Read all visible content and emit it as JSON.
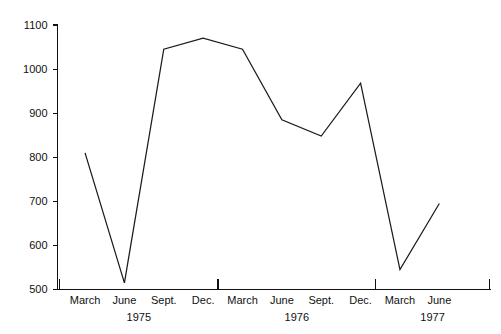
{
  "chart_data": {
    "type": "line",
    "title": "",
    "subtitle": "",
    "xlabel": "",
    "ylabel": "",
    "ylim": [
      500,
      1100
    ],
    "ytick_values": [
      500,
      600,
      700,
      800,
      900,
      1000,
      1100
    ],
    "ytick_labels": [
      "500",
      "600",
      "700",
      "800",
      "900",
      "1000",
      "1100"
    ],
    "grid": false,
    "legend": null,
    "legend_position": "none",
    "categories": [
      "March",
      "June",
      "Sept.",
      "Dec.",
      "March",
      "June",
      "Sept.",
      "Dec.",
      "March",
      "June"
    ],
    "x_group_labels": [
      "1975",
      "1976",
      "1977"
    ],
    "x_groups": [
      {
        "label": "1975",
        "categories": [
          "March",
          "June",
          "Sept.",
          "Dec."
        ]
      },
      {
        "label": "1976",
        "categories": [
          "March",
          "June",
          "Sept.",
          "Dec."
        ]
      },
      {
        "label": "1977",
        "categories": [
          "March",
          "June"
        ]
      }
    ],
    "points": [
      {
        "period": "March 1975",
        "value": 810
      },
      {
        "period": "June 1975",
        "value": 515
      },
      {
        "period": "Sept. 1975",
        "value": 1045
      },
      {
        "period": "Dec. 1975",
        "value": 1070
      },
      {
        "period": "March 1976",
        "value": 1045
      },
      {
        "period": "June 1976",
        "value": 885
      },
      {
        "period": "Sept. 1976",
        "value": 848
      },
      {
        "period": "Dec. 1976",
        "value": 968
      },
      {
        "period": "March 1977",
        "value": 545
      },
      {
        "period": "June 1977",
        "value": 695
      }
    ],
    "values": [
      810,
      515,
      1045,
      1070,
      1045,
      885,
      848,
      968,
      545,
      695
    ],
    "series": [
      {
        "name": "series-1",
        "color": "#1b1b1b",
        "values": [
          810,
          515,
          1045,
          1070,
          1045,
          885,
          848,
          968,
          545,
          695
        ]
      }
    ]
  },
  "colors": {
    "line": "#1b1b1b",
    "axis": "#111111",
    "text": "#111111",
    "background": "#ffffff"
  }
}
